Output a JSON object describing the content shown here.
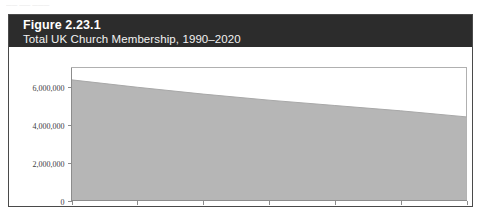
{
  "scan_artifact": {
    "text": "—— ——  ———"
  },
  "figure": {
    "number_label": "Figure 2.23.1",
    "subtitle": "Total UK Church Membership, 1990–2020",
    "header_bg": "#2c2c2c",
    "header_text_color": "#ffffff",
    "card_bg": "#ffffff",
    "card_border": "#4a4a4a"
  },
  "chart_data": {
    "type": "area",
    "title": "Total UK Church Membership, 1990–2020",
    "subtitle": "Figure 2.23.1",
    "xlabel": "",
    "ylabel": "",
    "x": [
      1990,
      1995,
      2000,
      2005,
      2010,
      2015,
      2020
    ],
    "values": [
      6350000,
      5960000,
      5600000,
      5280000,
      5000000,
      4720000,
      4400000
    ],
    "series": [
      {
        "name": "Total UK Church Membership",
        "values": [
          6350000,
          5960000,
          5600000,
          5280000,
          5000000,
          4720000,
          4400000
        ],
        "color": "#b6b6b6"
      }
    ],
    "xlim": [
      1990,
      2020
    ],
    "ylim": [
      0,
      7000000
    ],
    "ytick_values": [
      0,
      2000000,
      4000000,
      6000000
    ],
    "ytick_labels": [
      "0",
      "2,000,000",
      "4,000,000",
      "6,000,000"
    ],
    "xtick_values": [
      1990,
      1995,
      2000,
      2005,
      2010,
      2015,
      2020
    ],
    "xtick_labels": [
      "1990",
      "1995",
      "2000",
      "2005",
      "2010",
      "2015",
      "2020"
    ],
    "grid": false,
    "legend": false,
    "legend_position": "none",
    "fill_color": "#b6b6b6",
    "axis_color": "#8c8c8c",
    "frame_color": "#b0b0b0"
  }
}
